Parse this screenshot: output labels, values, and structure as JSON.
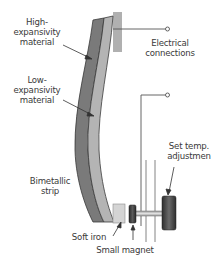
{
  "diagram": {
    "type": "bimetallic-thermostat",
    "labels": {
      "high_expansivity": "High-\nexpansivity\nmaterial",
      "low_expansivity": "Low-\nexpansivity\nmaterial",
      "electrical_connections": "Electrical\nconnections",
      "bimetallic_strip": "Bimetallic\nstrip",
      "set_temp_adjustment": "Set temp.\nadjustmen",
      "soft_iron": "Soft iron",
      "small_magnet": "Small magnet"
    },
    "colors": {
      "high_expansivity_layer": "#7a7a7a",
      "low_expansivity_layer": "#b4b4b4",
      "mount_block": "#b0b0b0",
      "soft_iron_block": "#d4d4d4",
      "magnet": "#3a3a3a",
      "knob": "#404040",
      "wire": "#555555",
      "text": "#3a3a3a"
    }
  }
}
